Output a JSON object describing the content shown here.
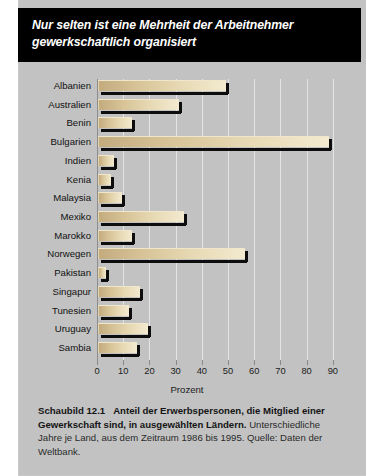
{
  "header": {
    "title": "Nur selten ist eine Mehrheit der Arbeitnehmer gewerkschaftlich organisiert"
  },
  "caption": {
    "figure_number": "Schaubild 12.1",
    "bold_text": "Anteil der Erwerbspersonen, die Mitglied einer Gewerkschaft sind, in ausgewählten Ländern.",
    "note_text": "Unterschiedliche Jahre je Land, aus dem Zeitraum 1986 bis 1995. Quelle: Daten der Weltbank."
  },
  "colors": {
    "panel_background": "#c9c9c9",
    "title_bar": "#000000",
    "title_text": "#ffffff",
    "bar_fill_dark": "#c3ab7e",
    "bar_fill_light": "#f3ead0",
    "bar_shadow": "#0d0d0d",
    "gridline": "#e4e4e4"
  },
  "chart_data": {
    "type": "bar",
    "orientation": "horizontal",
    "title": "Nur selten ist eine Mehrheit der Arbeitnehmer gewerkschaftlich organisiert",
    "xlabel": "Prozent",
    "ylabel": "",
    "xlim": [
      0,
      95
    ],
    "xticks": [
      0,
      10,
      20,
      30,
      40,
      50,
      60,
      70,
      80,
      90
    ],
    "xtick_labels": [
      "0",
      "10",
      "20",
      "30",
      "40",
      "50",
      "60",
      "70",
      "80",
      "90"
    ],
    "grid": true,
    "legend": false,
    "categories": [
      "Albanien",
      "Australien",
      "Benin",
      "Bulgarien",
      "Indien",
      "Kenia",
      "Malaysia",
      "Mexiko",
      "Marokko",
      "Norwegen",
      "Pakistan",
      "Singapur",
      "Tunesien",
      "Uruguay",
      "Sambia"
    ],
    "values": [
      49,
      31,
      13,
      88,
      6,
      5,
      9,
      33,
      13,
      56,
      3,
      16,
      12,
      19,
      15
    ]
  }
}
